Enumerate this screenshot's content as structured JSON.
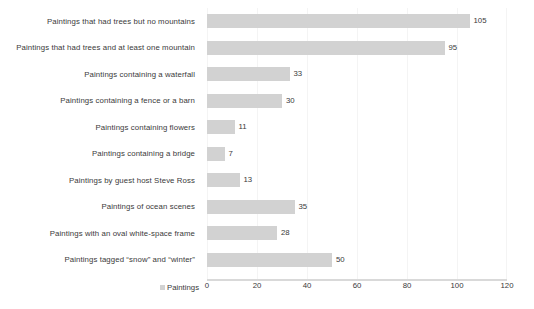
{
  "chart_data": {
    "type": "bar",
    "orientation": "horizontal",
    "title": "",
    "subtitle": "",
    "xlabel": "",
    "ylabel": "",
    "categories": [
      "Paintings that had trees but no mountains",
      "Paintings that had trees and at least one mountain",
      "Paintings containing a waterfall",
      "Paintings containing a fence or a barn",
      "Paintings containing flowers",
      "Paintings containing a bridge",
      "Paintings by guest host Steve Ross",
      "Paintings of ocean scenes",
      "Paintings with an oval white-space frame",
      "Paintings tagged “snow” and “winter”"
    ],
    "values": [
      105,
      95,
      33,
      30,
      11,
      7,
      13,
      35,
      28,
      50
    ],
    "data_labels": [
      "105",
      "95",
      "33",
      "30",
      "11",
      "7",
      "13",
      "35",
      "28",
      "50"
    ],
    "series": [
      {
        "name": "Paintings",
        "values": [
          105,
          95,
          33,
          30,
          11,
          7,
          13,
          35,
          28,
          50
        ],
        "color": "#d2d2d2"
      }
    ],
    "xlim": [
      0,
      120
    ],
    "x_ticks": [
      0,
      20,
      40,
      60,
      80,
      100,
      120
    ],
    "x_tick_labels": [
      "0",
      "20",
      "40",
      "60",
      "80",
      "100",
      "120"
    ],
    "grid": {
      "vertical": true,
      "horizontal": false,
      "color": "#f4f4f4"
    },
    "legend": {
      "position": "bottom-left",
      "entries": [
        "Paintings"
      ]
    },
    "bar_color": "#d2d2d2",
    "text_color": "#3a3a3a",
    "background": "#ffffff"
  },
  "legend": {
    "label": "Paintings",
    "swatch_color": "#d2d2d2"
  }
}
